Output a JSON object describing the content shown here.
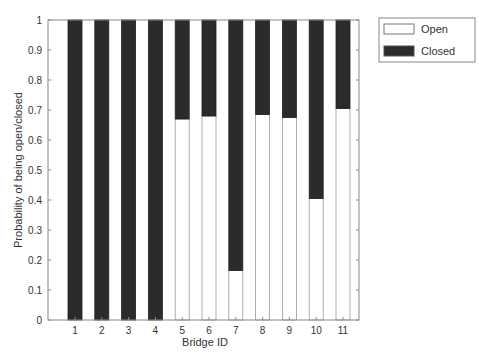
{
  "chart_data": {
    "type": "bar",
    "stacked": true,
    "title": "",
    "xlabel": "Bridge ID",
    "ylabel": "Probability of being open/closed",
    "categories": [
      "1",
      "2",
      "3",
      "4",
      "5",
      "6",
      "7",
      "8",
      "9",
      "10",
      "11"
    ],
    "series": [
      {
        "name": "Open",
        "color": "#ffffff",
        "values": [
          0,
          0,
          0,
          0,
          0.67,
          0.68,
          0.165,
          0.685,
          0.675,
          0.405,
          0.705
        ]
      },
      {
        "name": "Closed",
        "color": "#2b2b2b",
        "values": [
          1,
          1,
          1,
          1,
          0.33,
          0.32,
          0.835,
          0.315,
          0.325,
          0.595,
          0.295
        ]
      }
    ],
    "ylim": [
      0,
      1
    ],
    "yticks": [
      "0",
      "0.1",
      "0.2",
      "0.3",
      "0.4",
      "0.5",
      "0.6",
      "0.7",
      "0.8",
      "0.9",
      "1"
    ],
    "grid": false,
    "legend_position": "upper-right-outside"
  },
  "legend": {
    "open_label": "Open",
    "closed_label": "Closed"
  }
}
